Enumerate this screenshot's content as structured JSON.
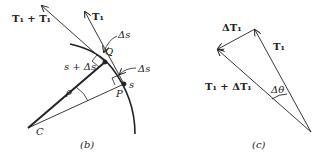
{
  "figure_b": {
    "caption": "(b)",
    "labels": {
      "t1_plus_t1": "T₁ + T₁",
      "t1": "T₁",
      "delta_s_top": "Δs",
      "delta_s_right": "Δs",
      "q": "Q",
      "s_plus_delta_s": "s + Δs",
      "s": "s",
      "p": "P",
      "rho": "ρ",
      "c": "C"
    }
  },
  "figure_c": {
    "caption": "(c)",
    "labels": {
      "delta_t1": "ΔT₁",
      "t1": "T₁",
      "t1_plus_delta_t1": "T₁ + ΔT₁",
      "delta_theta": "Δθ"
    }
  },
  "colors": {
    "ink": "#222222",
    "background": "#ffffff"
  }
}
